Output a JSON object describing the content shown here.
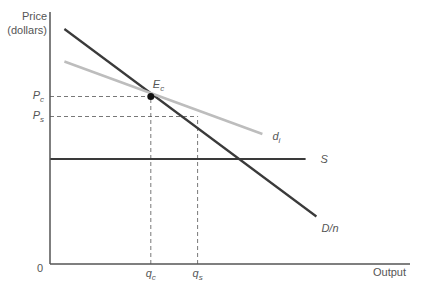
{
  "chart_data": {
    "type": "line",
    "title": "",
    "ylabel_line1": "Price",
    "ylabel_line2": "(dollars)",
    "xlabel": "Output",
    "origin_label": "0",
    "x_range": [
      0,
      100
    ],
    "y_range": [
      0,
      100
    ],
    "grid": false,
    "series": [
      {
        "name": "D/n",
        "label": "D/n",
        "color": "#3a3a3a",
        "points": [
          [
            4,
            94
          ],
          [
            74,
            19
          ]
        ]
      },
      {
        "name": "d_i",
        "label": "d",
        "subscript": "i",
        "color": "#bdbdbd",
        "points": [
          [
            4,
            81
          ],
          [
            59,
            52
          ]
        ]
      },
      {
        "name": "S",
        "label": "S",
        "color": "#3a3a3a",
        "points": [
          [
            0,
            42
          ],
          [
            71,
            42
          ]
        ]
      }
    ],
    "points": [
      {
        "name": "E_c",
        "label": "E",
        "subscript": "c",
        "x": 28,
        "y": 67
      }
    ],
    "dashed_levels": [
      {
        "axis": "y",
        "label": "P",
        "subscript": "c",
        "value": 67,
        "to_x": 28
      },
      {
        "axis": "y",
        "label": "P",
        "subscript": "s",
        "value": 59,
        "to_x": 41
      }
    ],
    "dashed_quantities": [
      {
        "axis": "x",
        "label": "q",
        "subscript": "c",
        "value": 28,
        "to_y": 67
      },
      {
        "axis": "x",
        "label": "q",
        "subscript": "s",
        "value": 41,
        "to_y": 59
      }
    ]
  }
}
